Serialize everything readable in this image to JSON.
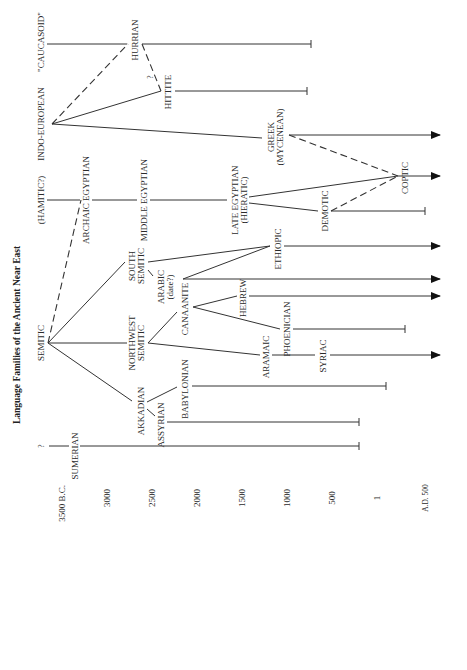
{
  "title": "Language Families of the Ancient Near East",
  "time_axis": {
    "ticks": [
      {
        "label": "3500 B.C.",
        "x": 62
      },
      {
        "label": "3000",
        "x": 107
      },
      {
        "label": "2500",
        "x": 152
      },
      {
        "label": "2000",
        "x": 197
      },
      {
        "label": "1500",
        "x": 242
      },
      {
        "label": "1000",
        "x": 287
      },
      {
        "label": "500",
        "x": 332
      },
      {
        "label": "1",
        "x": 377
      },
      {
        "label": "A.D. 500",
        "x": 425
      }
    ]
  },
  "families": {
    "caucasoid": "\"CAUCASOID\"",
    "indo_european": "INDO-EUROPEAN",
    "hamitic": "(HAMITIC?)",
    "semitic": "SEMITIC",
    "sumerian": "SUMERIAN",
    "sumerian_origin": "?"
  },
  "languages": {
    "hurrian": "HURRIAN",
    "hittite": "HITTITE",
    "hittite_q": "?",
    "greek": "GREEK",
    "greek_sub": "(MYCENEAN)",
    "archaic_egyptian": "ARCHAIC EGYPTIAN",
    "middle_egyptian": "MIDDLE EGYPTIAN",
    "late_egyptian": "LATE EGYPTIAN",
    "late_egyptian_sub": "(HIERATIC)",
    "demotic": "DEMOTIC",
    "coptic": "COPTIC",
    "south_semitic_1": "SOUTH",
    "south_semitic_2": "SEMITIC",
    "ethiopic": "ETHIOPIC",
    "arabic": "ARABIC",
    "arabic_sub": "(date?)",
    "northwest_semitic_1": "NORTHWEST",
    "northwest_semitic_2": "SEMITIC",
    "canaanite": "CANAANITE",
    "hebrew": "HEBREW",
    "phoenician": "PHOENICIAN",
    "aramaic": "ARAMAIC",
    "syriac": "SYRIAC",
    "akkadian": "AKKADIAN",
    "assyrian": "ASSYRIAN",
    "babylonian": "BABYLONIAN"
  },
  "legend": {
    "solid_line": "descent",
    "dashed_line": "uncertain relation / influence",
    "arrow": "continues beyond A.D. 500",
    "bar": "extinct"
  }
}
